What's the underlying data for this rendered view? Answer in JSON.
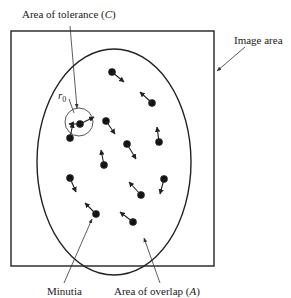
{
  "labels": {
    "tolerance": "Area of tolerance (C)",
    "tolerance_main": "Area of tolerance (",
    "tolerance_var": "C",
    "tolerance_close": ")",
    "image_area": "Image area",
    "radius_symbol": "r",
    "radius_subscript": "0",
    "minutia": "Minutia",
    "overlap_main": "Area of overlap (",
    "overlap_var": "A",
    "overlap_close": ")"
  },
  "geometry": {
    "image_rect": {
      "x": 11,
      "y": 31,
      "w": 203,
      "h": 235
    },
    "overlap_ellipse": {
      "cx": 114,
      "cy": 162,
      "rx": 77,
      "ry": 113
    },
    "tolerance_circle": {
      "cx": 79,
      "cy": 122,
      "r": 14
    }
  },
  "minutiae": [
    {
      "x": 79,
      "y": 123,
      "dx": 13,
      "dy": -6,
      "note": "in tolerance circle"
    },
    {
      "x": 79,
      "y": 123,
      "dx": -11,
      "dy": 0,
      "note": "in tolerance circle"
    },
    {
      "x": 111,
      "y": 72,
      "dx": 13,
      "dy": 10
    },
    {
      "x": 152,
      "y": 103,
      "dx": -13,
      "dy": -12
    },
    {
      "x": 106,
      "y": 120,
      "dx": 9,
      "dy": 14
    },
    {
      "x": 72,
      "y": 138,
      "dx": 2,
      "dy": -14
    },
    {
      "x": 160,
      "y": 142,
      "dx": -2,
      "dy": -15
    },
    {
      "x": 127,
      "y": 144,
      "dx": 9,
      "dy": 15
    },
    {
      "x": 103,
      "y": 164,
      "dx": -2,
      "dy": -15
    },
    {
      "x": 69,
      "y": 164,
      "dx": 0,
      "dy": 0,
      "note": "no visible arrow"
    },
    {
      "x": 159,
      "y": 164,
      "dx": 0,
      "dy": 0,
      "note": "no visible arrow"
    },
    {
      "x": 104,
      "y": 164,
      "dx": 0,
      "dy": 0
    },
    {
      "x": 70,
      "y": 180,
      "dx": 8,
      "dy": 14
    },
    {
      "x": 140,
      "y": 183,
      "dx": -13,
      "dy": -13
    },
    {
      "x": 164,
      "y": 180,
      "dx": -4,
      "dy": 16
    },
    {
      "x": 95,
      "y": 215,
      "dx": -11,
      "dy": -12
    },
    {
      "x": 133,
      "y": 222,
      "dx": -14,
      "dy": -11
    }
  ],
  "colors": {
    "stroke": "#222222",
    "pointer": "#333333",
    "background": "#ffffff"
  }
}
